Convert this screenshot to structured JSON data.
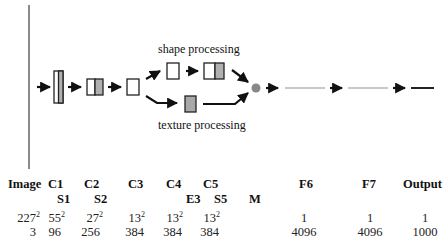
{
  "diagram": {
    "labels": {
      "shape_branch": "shape processing",
      "texture_branch": "texture processing"
    },
    "colors": {
      "divider": "#8a8a8a",
      "arrow": "#111111",
      "box_border": "#222222",
      "box_fill_gray": "#b0b0b0",
      "merge_node": "#888888",
      "fc_line_light": "#c8c8c8",
      "output_line": "#222222"
    }
  },
  "table": {
    "headers_row1": [
      "Image",
      "C1",
      "C2",
      "C3",
      "C4",
      "C5",
      "F6",
      "F7",
      "Output"
    ],
    "headers_row2": [
      "S1",
      "S2",
      "E3",
      "S5",
      "M"
    ],
    "spatial_row": [
      {
        "base": "227",
        "exp": "2"
      },
      {
        "base": "55",
        "exp": "2"
      },
      {
        "base": "27",
        "exp": "2"
      },
      {
        "base": "13",
        "exp": "2"
      },
      {
        "base": "13",
        "exp": "2"
      },
      {
        "base": "13",
        "exp": "2"
      },
      {
        "base": "1",
        "exp": ""
      },
      {
        "base": "1",
        "exp": ""
      },
      {
        "base": "1",
        "exp": ""
      }
    ],
    "channels_row": [
      "3",
      "96",
      "256",
      "384",
      "384",
      "384",
      "4096",
      "4096",
      "1000"
    ]
  }
}
